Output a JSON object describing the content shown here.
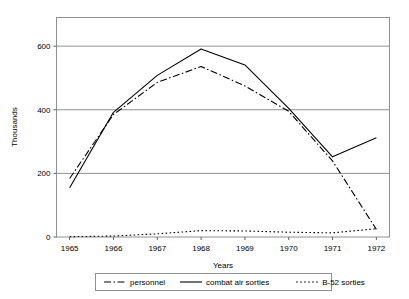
{
  "chart_data": {
    "type": "line",
    "title": "",
    "xlabel": "Years",
    "ylabel": "Thousands",
    "x": [
      1965,
      1966,
      1967,
      1968,
      1969,
      1970,
      1971,
      1972
    ],
    "categories": [
      "1965",
      "1966",
      "1967",
      "1968",
      "1969",
      "1970",
      "1971",
      "1972"
    ],
    "xlim": [
      1964.7,
      1972.3
    ],
    "ylim": [
      0,
      690
    ],
    "yticks": [
      0,
      200,
      400,
      600
    ],
    "ytick_labels": [
      "0",
      "200",
      "400",
      "600"
    ],
    "grid": "horizontal",
    "legend_position": "bottom",
    "series": [
      {
        "name": "personnel",
        "style": "dash-dot",
        "color": "#000000",
        "values": [
          184,
          385,
          486,
          536,
          475,
          395,
          239,
          24
        ]
      },
      {
        "name": "combat air sorties",
        "style": "solid",
        "color": "#000000",
        "values": [
          155,
          392,
          508,
          591,
          541,
          404,
          252,
          312
        ]
      },
      {
        "name": "B-52 sorties",
        "style": "dotted",
        "color": "#000000",
        "values": [
          1,
          3,
          10,
          20,
          19,
          15,
          13,
          26
        ]
      }
    ]
  },
  "axes": {
    "y_title": "Thousands",
    "x_title": "Years",
    "y_tick_labels": [
      "600",
      "400",
      "200",
      "0"
    ],
    "x_tick_labels": [
      "1965",
      "1966",
      "1967",
      "1968",
      "1969",
      "1970",
      "1971",
      "1972"
    ]
  },
  "legend": {
    "items": [
      {
        "label": "personnel",
        "style": "dash-dot"
      },
      {
        "label": "combat air sorties",
        "style": "solid"
      },
      {
        "label": "B-52 sorties",
        "style": "dotted"
      }
    ]
  },
  "colors": {
    "line": "#000000",
    "grid": "#808080",
    "frame": "#808080",
    "background": "#ffffff"
  }
}
